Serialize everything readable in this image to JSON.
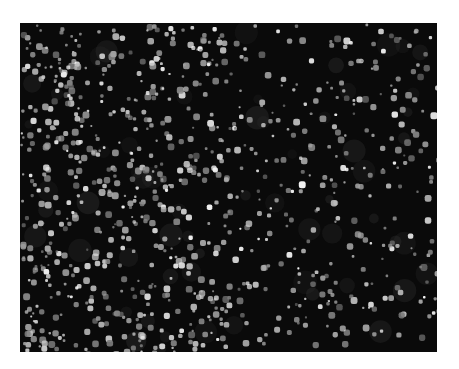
{
  "image": {
    "description": "Dark-field micrograph of numerous bright particles scattered over a black background",
    "background_color": "#0a0a0a",
    "particle_color": "#f2f2f2",
    "page_background": "#ffffff",
    "frame": {
      "x": 20,
      "y": 23,
      "width": 417,
      "height": 329
    },
    "particle_count_approx": 900,
    "density_note": "denser on the left side, sparser toward the right"
  }
}
